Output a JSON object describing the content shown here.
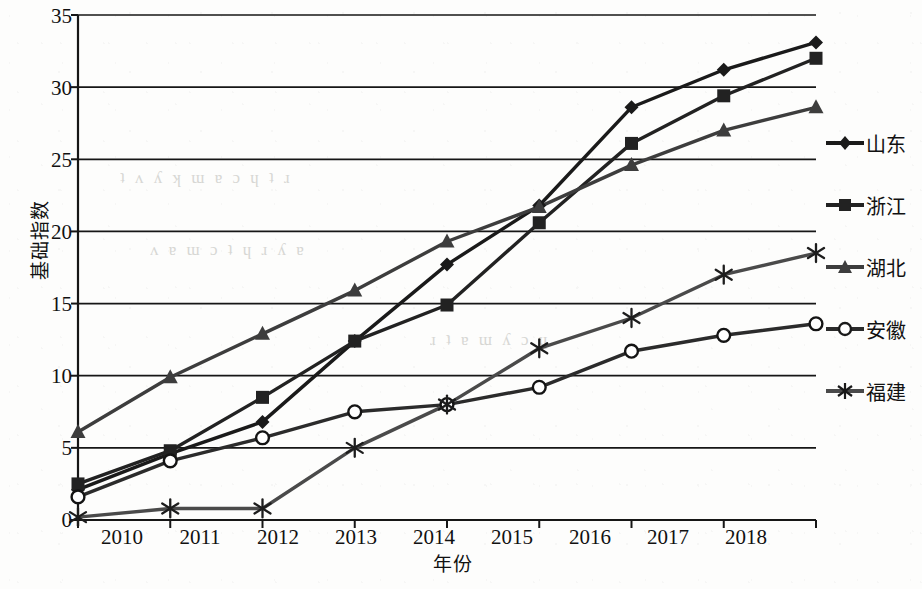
{
  "chart_data": {
    "type": "line",
    "title": "",
    "xlabel": "年份",
    "ylabel": "基础指数",
    "categories": [
      "2010",
      "2011",
      "2012",
      "2013",
      "2014",
      "2015",
      "2016",
      "2017",
      "2018"
    ],
    "x": [
      2010,
      2011,
      2012,
      2013,
      2014,
      2015,
      2016,
      2017,
      2018
    ],
    "xlim": [
      2010,
      2018
    ],
    "ylim": [
      0,
      35
    ],
    "yticks": [
      0,
      5,
      10,
      15,
      20,
      25,
      30,
      35
    ],
    "grid": true,
    "legend_position": "right",
    "series": [
      {
        "name": "山东",
        "marker": "diamond",
        "color": "#1a1a1a",
        "values": [
          2.1,
          4.6,
          6.8,
          12.4,
          17.7,
          21.8,
          28.6,
          31.2,
          33.1
        ]
      },
      {
        "name": "浙江",
        "marker": "square",
        "color": "#222222",
        "values": [
          2.5,
          4.8,
          8.5,
          12.4,
          14.9,
          20.6,
          26.1,
          29.4,
          32.0
        ]
      },
      {
        "name": "湖北",
        "marker": "triangle",
        "color": "#3d3d3d",
        "values": [
          6.1,
          9.9,
          12.9,
          15.9,
          19.3,
          21.7,
          24.6,
          27.0,
          28.6
        ]
      },
      {
        "name": "安徽",
        "marker": "circle-open",
        "color": "#2b2b2b",
        "values": [
          1.6,
          4.1,
          5.7,
          7.5,
          8.0,
          9.2,
          11.7,
          12.8,
          13.6
        ]
      },
      {
        "name": "福建",
        "marker": "asterisk",
        "color": "#4a4a4a",
        "values": [
          0.2,
          0.8,
          0.8,
          5.0,
          8.0,
          11.9,
          14.0,
          17.0,
          18.5
        ]
      }
    ]
  },
  "legend": {
    "items": [
      {
        "label": "山东"
      },
      {
        "label": "浙江"
      },
      {
        "label": "湖北"
      },
      {
        "label": "安徽"
      },
      {
        "label": "福建"
      }
    ]
  },
  "axes": {
    "y_title": "基础指数",
    "x_title": "年份",
    "y_ticks": [
      "35",
      "30",
      "25",
      "20",
      "15",
      "10",
      "5",
      "0"
    ],
    "x_ticks": [
      "2010",
      "2011",
      "2012",
      "2013",
      "2014",
      "2015",
      "2016",
      "2017",
      "2018"
    ]
  }
}
